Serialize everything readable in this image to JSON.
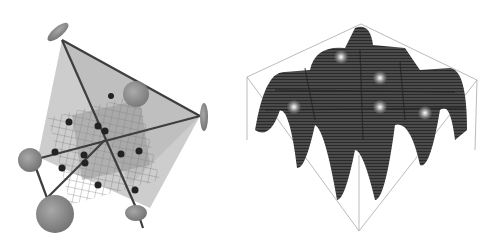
{
  "figure": {
    "panels": [
      {
        "id": "left",
        "description": "optical lattice setup: laser beams forming tetrahedral arrangement with atoms in 3D lattice grid",
        "mirrors": 6,
        "atoms": 14,
        "colors": {
          "beam_plane": "#b9b9b9",
          "grid": "#7a7a7a",
          "atom": "#222222",
          "mirror": "#8a8a8a",
          "beam": "#444444"
        }
      },
      {
        "id": "right",
        "description": "3D surface plot of periodic lattice potential with trapped atoms in wells",
        "wells_grid": "4x4",
        "atoms_visible": 6,
        "colors": {
          "surface": "#3c3c3c",
          "box": "#aaaaaa",
          "atom": "#bbbbbb"
        }
      }
    ]
  }
}
